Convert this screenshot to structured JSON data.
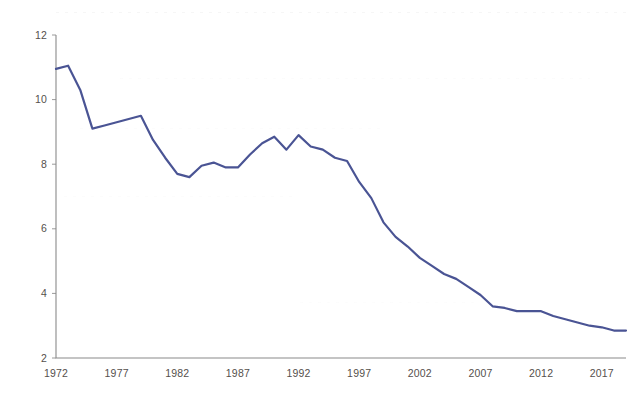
{
  "chart_data": {
    "type": "line",
    "title": "",
    "subtitle": "",
    "xlabel": "",
    "ylabel": "",
    "xlim": [
      1972,
      2019
    ],
    "ylim": [
      2,
      12
    ],
    "grid": false,
    "legend": false,
    "legend_position": "none",
    "line_color": "#4a5494",
    "line_width": 2.2,
    "y_ticks": [
      2,
      4,
      6,
      8,
      10,
      12
    ],
    "y_tick_labels": [
      "2",
      "4",
      "6",
      "8",
      "10",
      "12"
    ],
    "x_ticks": [
      1972,
      1977,
      1982,
      1987,
      1992,
      1997,
      2002,
      2007,
      2012,
      2017
    ],
    "x_tick_labels": [
      "1972",
      "1977",
      "1982",
      "1987",
      "1992",
      "1997",
      "2002",
      "2007",
      "2012",
      "2017"
    ],
    "x": [
      1972,
      1973,
      1974,
      1975,
      1976,
      1977,
      1978,
      1979,
      1980,
      1981,
      1982,
      1983,
      1984,
      1985,
      1986,
      1987,
      1988,
      1989,
      1990,
      1991,
      1992,
      1993,
      1994,
      1995,
      1996,
      1997,
      1998,
      1999,
      2000,
      2001,
      2002,
      2003,
      2004,
      2005,
      2006,
      2007,
      2008,
      2009,
      2010,
      2011,
      2012,
      2013,
      2014,
      2015,
      2016,
      2017,
      2018,
      2019
    ],
    "series": [
      {
        "name": "series-1",
        "color": "#4a5494",
        "values": [
          10.95,
          11.05,
          10.3,
          9.1,
          9.2,
          9.3,
          9.4,
          9.5,
          8.75,
          8.2,
          7.7,
          7.6,
          7.95,
          8.05,
          7.9,
          7.9,
          8.3,
          8.65,
          8.85,
          8.45,
          8.9,
          8.55,
          8.45,
          8.2,
          8.1,
          7.45,
          6.95,
          6.2,
          5.75,
          5.45,
          5.1,
          4.85,
          4.6,
          4.45,
          4.2,
          3.95,
          3.6,
          3.55,
          3.45,
          3.45,
          3.45,
          3.3,
          3.2,
          3.1,
          3.0,
          2.95,
          2.85,
          2.85
        ]
      }
    ]
  },
  "axes": {
    "y_axis_name": "value-axis",
    "x_axis_name": "year-axis"
  }
}
